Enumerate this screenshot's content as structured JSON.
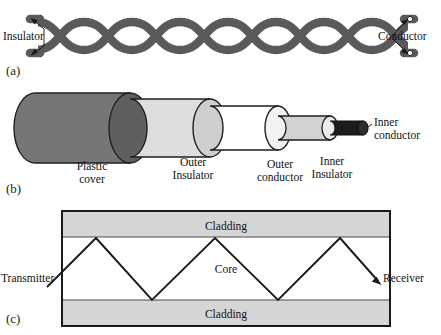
{
  "figure": {
    "panels": [
      {
        "tag": "(a)",
        "name": "twisted-pair"
      },
      {
        "tag": "(b)",
        "name": "coaxial-cable"
      },
      {
        "tag": "(c)",
        "name": "optical-fiber"
      }
    ]
  },
  "twisted_pair": {
    "labels": {
      "insulator": "Insulator",
      "conductor": "Conductor"
    },
    "colors": {
      "wire": "#5a5a5a",
      "outline": "#3d3d3d",
      "terminal": "#ffffff"
    },
    "loops": 5
  },
  "coax": {
    "layers": [
      {
        "name": "plastic-cover",
        "label": "Plastic\ncover",
        "color": "#7d7d7d"
      },
      {
        "name": "outer-insulator",
        "label": "Outer\nInsulator",
        "color": "#d9d9d9"
      },
      {
        "name": "outer-conductor",
        "label": "Outer\nconductor",
        "color": "#ffffff"
      },
      {
        "name": "inner-insulator",
        "label": "Inner\nInsulator",
        "color": "#c9c9c9"
      },
      {
        "name": "inner-conductor",
        "label": "Inner\nconductor",
        "color": "#1c1c1c"
      }
    ],
    "labels": {
      "plastic_cover_line1": "Plastic",
      "plastic_cover_line2": "cover",
      "outer_insulator_line1": "Outer",
      "outer_insulator_line2": "Insulator",
      "outer_conductor_line1": "Outer",
      "outer_conductor_line2": "conductor",
      "inner_insulator_line1": "Inner",
      "inner_insulator_line2": "Insulator",
      "inner_conductor_line1": "Inner",
      "inner_conductor_line2": "conductor"
    }
  },
  "fiber": {
    "labels": {
      "cladding_top": "Cladding",
      "cladding_bottom": "Cladding",
      "core": "Core",
      "transmitter": "Transmitter",
      "receiver": "Receiver"
    },
    "colors": {
      "cladding": "#d6d6d6",
      "core": "#ffffff",
      "border": "#1a1a1a",
      "ray": "#1a1a1a"
    },
    "ray_bounces": 4
  }
}
